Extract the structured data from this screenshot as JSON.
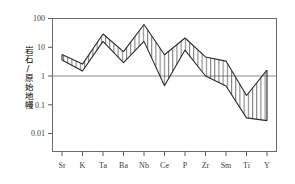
{
  "chart_data": {
    "type": "area",
    "title": "",
    "subtitle": "",
    "xlabel": "",
    "ylabel": "岩石/原始地幔",
    "yscale": "log",
    "ylim": [
      0.004,
      100
    ],
    "ytick_labels": [
      "100",
      "10",
      "1",
      "0.1",
      "0.01"
    ],
    "ytick_values": [
      100,
      10,
      1,
      0.1,
      0.01
    ],
    "grid": false,
    "legend": null,
    "reference_line": {
      "value": 1,
      "label": ""
    },
    "categories": [
      "Sr",
      "K",
      "Ta",
      "Ba",
      "Nb",
      "Ce",
      "P",
      "Zr",
      "Sm",
      "Ti",
      "Y"
    ],
    "series": [
      {
        "name": "upper",
        "values": [
          5.6,
          2.6,
          29.0,
          7.0,
          62.0,
          5.5,
          21.0,
          4.6,
          3.3,
          0.21,
          1.6
        ]
      },
      {
        "name": "lower",
        "values": [
          3.6,
          1.5,
          16.0,
          2.9,
          16.0,
          0.46,
          8.0,
          1.0,
          0.45,
          0.035,
          0.028
        ]
      }
    ],
    "band_fill": "hatched-vertical",
    "line_color": "#2a2a2a"
  },
  "axes": {
    "x_tick_count": 11,
    "y_axis_caption": "岩石/原始地幔"
  }
}
